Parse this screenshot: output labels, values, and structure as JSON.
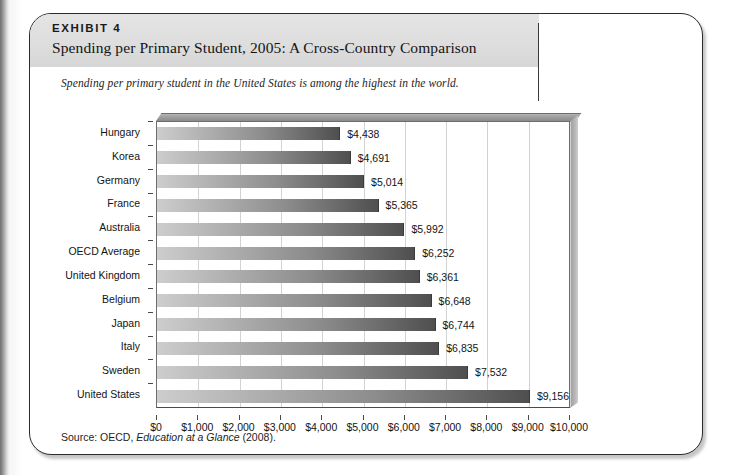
{
  "exhibit": {
    "kicker": "EXHIBIT 4",
    "title": "Spending per Primary Student, 2005: A Cross-Country Comparison",
    "subtitle": "Spending per primary student in the United States is among the highest in the world.",
    "source_prefix": "Source: OECD, ",
    "source_italic": "Education at a Glance",
    "source_suffix": " (2008)."
  },
  "chart_data": {
    "type": "bar",
    "orientation": "horizontal",
    "title": "Spending per Primary Student, 2005: A Cross-Country Comparison",
    "xlabel": "",
    "ylabel": "",
    "xlim": [
      0,
      10000
    ],
    "grid": true,
    "legend": "none",
    "categories": [
      "Hungary",
      "Korea",
      "Germany",
      "France",
      "Australia",
      "OECD Average",
      "United Kingdom",
      "Belgium",
      "Japan",
      "Italy",
      "Sweden",
      "United States"
    ],
    "values": [
      4438,
      4691,
      5014,
      5365,
      5992,
      6252,
      6361,
      6648,
      6744,
      6835,
      7532,
      9156
    ],
    "value_labels": [
      "$4,438",
      "$4,691",
      "$5,014",
      "$5,365",
      "$5,992",
      "$6,252",
      "$6,361",
      "$6,648",
      "$6,744",
      "$6,835",
      "$7,532",
      "$9,156"
    ],
    "xticks": [
      0,
      1000,
      2000,
      3000,
      4000,
      5000,
      6000,
      7000,
      8000,
      9000,
      10000
    ],
    "xtick_labels": [
      "$0",
      "$1,000",
      "$2,000",
      "$3,000",
      "$4,000",
      "$5,000",
      "$6,000",
      "$7,000",
      "$8,000",
      "$9,000",
      "$10,000"
    ],
    "colors": {
      "bar_light": "#cdcdcd",
      "bar_dark": "#4f4f4f",
      "grid": "#d2d2d2",
      "axis": "#4a4a4a",
      "header_band": "#dedede",
      "text": "#131313"
    }
  }
}
